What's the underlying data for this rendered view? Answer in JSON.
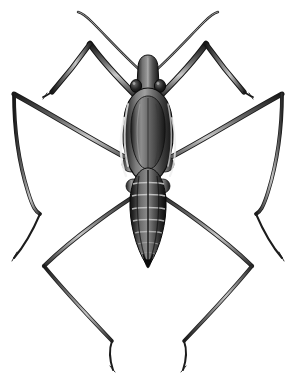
{
  "figure": {
    "kind": "scientific-illustration",
    "subject_common_name": "Water strider",
    "subject_family": "Gerridae",
    "view": "dorsal",
    "technique": "grayscale stipple and line drawing",
    "caption": "",
    "title": "",
    "background_color": "#ffffff",
    "canvas": {
      "width": 295,
      "height": 375
    }
  },
  "palette": {
    "background": "#ffffff",
    "outline": "#1a1a1a",
    "body_darkest": "#121212",
    "body_dark": "#2b2b2b",
    "body_mid": "#4f4f4f",
    "body_light": "#8a8a8a",
    "body_highlight": "#d8d8d8",
    "leg_dark": "#242424",
    "leg_mid": "#5a5a5a",
    "leg_light": "#b4b4b4"
  },
  "anatomy": {
    "head": {
      "label": "head",
      "cx": 149,
      "cy": 72,
      "width": 16,
      "height": 30
    },
    "eyes": {
      "label": "compound eyes",
      "left_cx": 137,
      "right_cx": 161,
      "cy": 86,
      "r": 5
    },
    "antennae": {
      "label": "antennae",
      "count": 2,
      "tip_left": [
        80,
        12
      ],
      "tip_right": [
        216,
        12
      ]
    },
    "thorax": {
      "label": "thorax / pronotum",
      "cx": 148,
      "cy": 130,
      "width": 40,
      "height": 80
    },
    "abdomen": {
      "label": "abdomen",
      "cx": 148,
      "cy": 210,
      "width": 30,
      "height": 110,
      "segments": 7
    },
    "forelegs": {
      "label": "forelegs",
      "count": 2,
      "origin": [
        148,
        92
      ]
    },
    "midlegs": {
      "label": "middle legs",
      "count": 2,
      "origin": [
        148,
        165
      ],
      "apex_left": [
        12,
        93
      ],
      "apex_right": [
        283,
        93
      ]
    },
    "hindlegs": {
      "label": "hind legs",
      "count": 2,
      "origin": [
        148,
        188
      ],
      "apex_left": [
        42,
        268
      ],
      "apex_right": [
        253,
        268
      ]
    }
  },
  "measurements": {
    "body_length_px": 205,
    "leg_span_px": 283,
    "segment_band_count": 7
  }
}
